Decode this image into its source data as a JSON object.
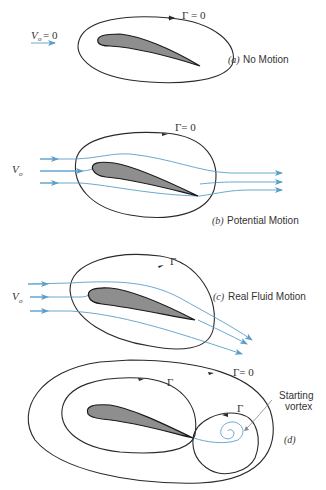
{
  "figure": {
    "panels": [
      {
        "id": "a",
        "tag": "(a)",
        "caption": "No Motion",
        "circulation_label": "Γ = 0",
        "velocity_label": "V",
        "velocity_subscript": "o",
        "velocity_value": "= 0"
      },
      {
        "id": "b",
        "tag": "(b)",
        "caption": "Potential Motion",
        "circulation_label": "Γ= 0",
        "velocity_label": "V",
        "velocity_subscript": "o"
      },
      {
        "id": "c",
        "tag": "(c)",
        "caption": "Real Fluid Motion",
        "circulation_label": "Γ",
        "velocity_label": "V",
        "velocity_subscript": "o"
      },
      {
        "id": "d",
        "tag": "(d)",
        "caption": "",
        "outer_circulation_label": "Γ= 0",
        "inner_circulation_label": "Γ",
        "vortex_circulation_label": "Γ",
        "vortex_annotation_line1": "Starting",
        "vortex_annotation_line2": "vortex"
      }
    ],
    "colors": {
      "streamline": "#5a9ec9",
      "airfoil_fill": "#8e8e8e",
      "contour": "#2a2a2a"
    }
  }
}
